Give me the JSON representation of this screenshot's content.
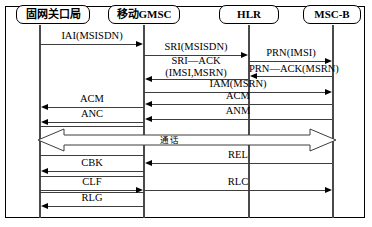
{
  "diagram": {
    "participants": [
      {
        "id": "gateway",
        "label": "固网关口局",
        "x": 40
      },
      {
        "id": "gmsc",
        "label": "移动GMSC",
        "x": 144
      },
      {
        "id": "hlr",
        "label": "HLR",
        "x": 249
      },
      {
        "id": "mscb",
        "label": "MSC-B",
        "x": 333
      }
    ],
    "messages": [
      {
        "label": "IAI(MSISDN)",
        "from": "gateway",
        "to": "gmsc",
        "y": 44,
        "dir": "right"
      },
      {
        "label": "SRI(MSISDN)",
        "from": "gmsc",
        "to": "hlr",
        "y": 55,
        "dir": "right"
      },
      {
        "label": "PRN(IMSI)",
        "from": "hlr",
        "to": "mscb",
        "y": 61,
        "dir": "right"
      },
      {
        "label": "SRI—ACK",
        "label2": "(IMSI,MSRN)",
        "from": "hlr",
        "to": "gmsc",
        "y": 79,
        "dir": "left"
      },
      {
        "label": "PRN—ACK(MSRN)",
        "from": "mscb",
        "to": "hlr",
        "y": 76,
        "dir": "left"
      },
      {
        "label": "IAM(MSRN)",
        "from": "gmsc",
        "to": "mscb",
        "y": 92,
        "dir": "right"
      },
      {
        "label": "ACM",
        "from": "mscb",
        "to": "gmsc",
        "y": 104,
        "dir": "left"
      },
      {
        "label": "ACM",
        "from": "gmsc",
        "to": "gateway",
        "y": 107,
        "dir": "left"
      },
      {
        "label": "ANM",
        "from": "mscb",
        "to": "gmsc",
        "y": 119,
        "dir": "left"
      },
      {
        "label": "ANC",
        "from": "gmsc",
        "to": "gateway",
        "y": 122,
        "dir": "left"
      },
      {
        "label": "REL",
        "from": "mscb",
        "to": "gmsc",
        "y": 163,
        "dir": "left"
      },
      {
        "label": "CBK",
        "from": "gmsc",
        "to": "gateway",
        "y": 171,
        "dir": "left"
      },
      {
        "label": "CLF",
        "from": "gateway",
        "to": "gmsc",
        "y": 190,
        "dir": "right"
      },
      {
        "label": "RLC",
        "from": "gmsc",
        "to": "mscb",
        "y": 190,
        "dir": "right"
      },
      {
        "label": "RLG",
        "from": "gmsc",
        "to": "gateway",
        "y": 206,
        "dir": "left"
      }
    ],
    "call_band": {
      "label": "通话",
      "description": "bidirectional conversation phase spanning gateway to MSC-B"
    },
    "colors": {
      "line": "#3d3d3d",
      "lifeline": "#4a4a4a",
      "border": "#000000",
      "background": "#ffffff"
    }
  }
}
